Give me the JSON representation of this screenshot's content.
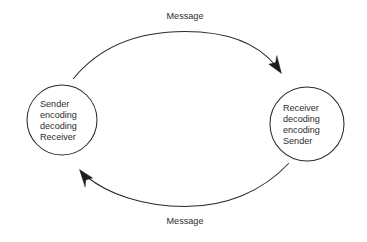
{
  "canvas": {
    "width": 367,
    "height": 242,
    "background": "#ffffff",
    "stroke_color": "#2b2b2b",
    "text_color": "#2e2e2e"
  },
  "diagram": {
    "type": "cycle",
    "title": "",
    "nodes": [
      {
        "id": "left-node",
        "shape": "circle",
        "cx": 62,
        "cy": 120,
        "r": 35,
        "lines": [
          "Sender",
          "encoding",
          "decoding",
          "Receiver"
        ]
      },
      {
        "id": "right-node",
        "shape": "circle",
        "cx": 307,
        "cy": 124,
        "r": 37,
        "lines": [
          "Receiver",
          "decoding",
          "encoding",
          "Sender"
        ]
      }
    ],
    "edges": [
      {
        "id": "top-edge",
        "label": "Message",
        "from": "left-node",
        "to": "right-node",
        "direction": "left-to-right",
        "label_x": 185,
        "label_y": 19
      },
      {
        "id": "bottom-edge",
        "label": "Message",
        "from": "right-node",
        "to": "left-node",
        "direction": "right-to-left",
        "label_x": 185,
        "label_y": 224
      }
    ]
  }
}
